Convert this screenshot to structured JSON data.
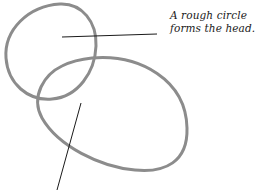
{
  "diagram": {
    "annotations": [
      {
        "id": "head",
        "lines": [
          "A rough circle",
          "forms the head."
        ]
      },
      {
        "id": "body",
        "lines": []
      }
    ],
    "shapes": {
      "head": {
        "type": "circle",
        "cx": 51,
        "cy": 51,
        "rx": 46,
        "ry": 48
      },
      "body": {
        "type": "ellipse",
        "cx": 112,
        "cy": 115,
        "rx": 76,
        "ry": 55,
        "rotate": 12
      }
    },
    "colors": {
      "stroke": "#8c8c8c",
      "pointer": "#1a1a1a",
      "text": "#1a1a1a",
      "background": "#ffffff"
    }
  }
}
